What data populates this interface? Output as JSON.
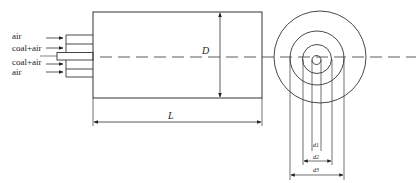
{
  "inlet_labels": [
    "air",
    "coal+air",
    "coal+air",
    "air"
  ],
  "dimensions": {
    "diameter": "D",
    "length": "L",
    "d1": "d1",
    "d2": "d2",
    "d3": "d3"
  },
  "colors": {
    "line": "#333333",
    "background": "#ffffff"
  }
}
